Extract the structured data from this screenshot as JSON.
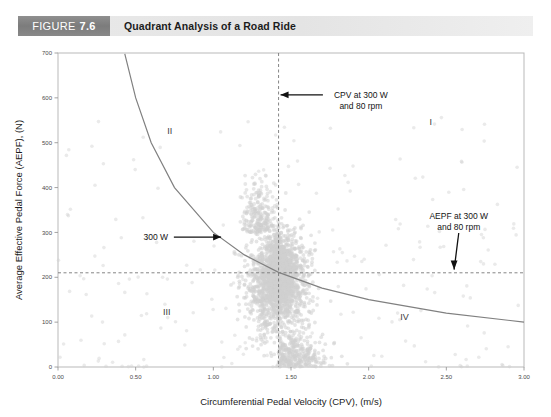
{
  "caption": {
    "figure_word": "FIGURE",
    "figure_number": "7.6",
    "title": "Quadrant Analysis of a Road Ride"
  },
  "chart_data": {
    "type": "scatter",
    "title": "Quadrant Analysis of a Road Ride",
    "xlabel": "Circumferential Pedal Velocity (CPV), (m/s)",
    "ylabel": "Average Effective Pedal Force (AEPF), (N)",
    "xlim": [
      0.0,
      3.0
    ],
    "ylim": [
      0,
      700
    ],
    "xticks": [
      "0.00",
      "0.50",
      "1.00",
      "1.50",
      "2.00",
      "2.50",
      "3.00"
    ],
    "xtick_values": [
      0.0,
      0.5,
      1.0,
      1.5,
      2.0,
      2.5,
      3.0
    ],
    "yticks": [
      "0",
      "100",
      "200",
      "300",
      "400",
      "500",
      "600",
      "700"
    ],
    "ytick_values": [
      0,
      100,
      200,
      300,
      400,
      500,
      600,
      700
    ],
    "grid": false,
    "legend": "none",
    "marker_color": "#d0d0d0",
    "curve_color": "#808080",
    "reference_lines": [
      {
        "name": "cpv-threshold",
        "orientation": "vertical",
        "value": 1.42,
        "style": "dashed",
        "label": "CPV at 300 W and 80 rpm"
      },
      {
        "name": "aepf-threshold",
        "orientation": "horizontal",
        "value": 210,
        "style": "dashed",
        "label": "AEPF at 300 W and 80 rpm"
      }
    ],
    "power_curve": {
      "name": "300 W isopower hyperbola",
      "label": "300 W",
      "equation": "AEPF = 300 / CPV",
      "power_watts": 300,
      "points": [
        {
          "x": 0.43,
          "y": 698
        },
        {
          "x": 0.5,
          "y": 600
        },
        {
          "x": 0.6,
          "y": 500
        },
        {
          "x": 0.75,
          "y": 400
        },
        {
          "x": 1.0,
          "y": 300
        },
        {
          "x": 1.2,
          "y": 250
        },
        {
          "x": 1.42,
          "y": 211
        },
        {
          "x": 1.7,
          "y": 176
        },
        {
          "x": 2.0,
          "y": 150
        },
        {
          "x": 2.5,
          "y": 120
        },
        {
          "x": 3.0,
          "y": 100
        }
      ]
    },
    "quadrants": [
      {
        "id": "I",
        "label": "I",
        "x": 2.4,
        "y": 540,
        "meaning": "high force, high velocity"
      },
      {
        "id": "II",
        "label": "II",
        "x": 0.72,
        "y": 520,
        "meaning": "high force, low velocity"
      },
      {
        "id": "III",
        "label": "III",
        "x": 0.7,
        "y": 115,
        "meaning": "low force, low velocity"
      },
      {
        "id": "IV",
        "label": "IV",
        "x": 2.23,
        "y": 105,
        "meaning": "low force, high velocity"
      }
    ],
    "annotations": [
      {
        "name": "cpv-annotation",
        "lines": [
          "CPV at 300 W",
          "and 80 rpm"
        ],
        "text_x": 1.95,
        "text_y": 600,
        "arrow": "left",
        "points_to": {
          "x": 1.42,
          "y": 580
        }
      },
      {
        "name": "aepf-annotation",
        "lines": [
          "AEPF at 300 W",
          "and 80 rpm"
        ],
        "text_x": 2.58,
        "text_y": 330,
        "arrow": "down",
        "points_to": {
          "x": 2.55,
          "y": 215
        }
      },
      {
        "name": "power-annotation",
        "lines": [
          "300 W"
        ],
        "text_x": 0.63,
        "text_y": 283,
        "arrow": "right",
        "points_to": {
          "x": 1.05,
          "y": 283
        }
      }
    ],
    "scatter_description": "Dense vertical cloud of ride data centered near CPV 1.2-1.7 m/s spanning AEPF 0-450 N, with sparse outliers across the field.",
    "series": [
      {
        "name": "road ride pedal strokes",
        "n_points": 1400,
        "cloud_center": {
          "x": 1.42,
          "y": 190
        },
        "cloud_spread": {
          "x": 0.17,
          "y": 105
        }
      }
    ]
  }
}
